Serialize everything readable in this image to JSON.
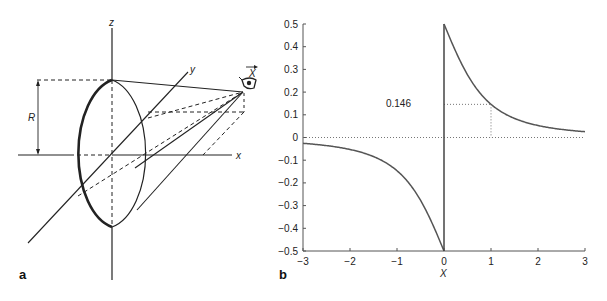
{
  "panels": {
    "a": {
      "label": "a",
      "axes": {
        "x": "x",
        "y": "y",
        "z": "z"
      },
      "radius_label": "R",
      "observer_label": "X",
      "observer_icon": "eye-icon"
    },
    "b": {
      "label": "b",
      "annotation": "0.146"
    }
  },
  "chart_data": {
    "type": "line",
    "title": "",
    "xlabel": "X",
    "ylabel": "",
    "xlim": [
      -3,
      3
    ],
    "ylim": [
      -0.5,
      0.5
    ],
    "xticks": [
      -3,
      -2,
      -1,
      0,
      1,
      2,
      3
    ],
    "xtick_labels": [
      "−3",
      "−2",
      "−1",
      "0",
      "1",
      "2",
      "3"
    ],
    "yticks": [
      0.5,
      0.4,
      0.3,
      0.2,
      0.1,
      0,
      -0.1,
      -0.2,
      -0.3,
      -0.4,
      -0.5
    ],
    "ytick_labels": [
      "0.5",
      "0.4",
      "0.3",
      "0.2",
      "0.1",
      "0",
      "−0.1",
      "−0.2",
      "−0.3",
      "−0.4",
      "−0.5"
    ],
    "grid": false,
    "legend": null,
    "series": [
      {
        "name": "f(X)",
        "x": [
          -3,
          -2.5,
          -2,
          -1.5,
          -1,
          -0.75,
          -0.5,
          -0.25,
          0,
          0,
          0.25,
          0.5,
          0.75,
          1,
          1.5,
          2,
          2.5,
          3
        ],
        "y": [
          -0.026,
          -0.036,
          -0.053,
          -0.084,
          -0.146,
          -0.2,
          -0.276,
          -0.379,
          -0.5,
          0.5,
          0.379,
          0.276,
          0.2,
          0.146,
          0.084,
          0.053,
          0.036,
          0.026
        ]
      }
    ],
    "annotations": [
      {
        "text": "0.146",
        "x": 1,
        "y": 0.146,
        "style": "dotted guide lines to axes"
      },
      {
        "text": "",
        "y": 0,
        "style": "dotted horizontal zero line"
      }
    ]
  }
}
